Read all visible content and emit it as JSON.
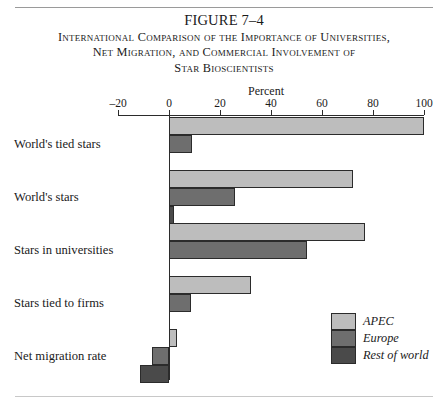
{
  "figure": {
    "number": "FIGURE 7–4",
    "title_lines": [
      "International Comparison of the Importance of Universities,",
      "Net Migration, and Commercial Involvement of",
      "Star Bioscientists"
    ]
  },
  "chart_data": {
    "type": "bar",
    "orientation": "horizontal",
    "title": "International Comparison of the Importance of Universities, Net Migration, and Commercial Involvement of Star Bioscientists",
    "xlabel": "Percent",
    "ylabel": "",
    "xlim": [
      -20,
      100
    ],
    "xticks": [
      -20,
      0,
      20,
      40,
      60,
      80,
      100
    ],
    "xticklabels": [
      "–20",
      "0",
      "20",
      "40",
      "60",
      "80",
      "100"
    ],
    "grid": false,
    "legend_position": "bottom-right",
    "categories": [
      "World's tied stars",
      "World's stars",
      "Stars in universities",
      "Stars tied to firms",
      "Net migration rate"
    ],
    "series": [
      {
        "name": "APEC",
        "color": "#bdbdbd",
        "values": [
          100,
          72,
          77,
          32,
          3
        ]
      },
      {
        "name": "Europe",
        "color": "#6e6e6e",
        "values": [
          9,
          26,
          54,
          8.5,
          -6.5
        ]
      },
      {
        "name": "Rest of world",
        "color": "#4a4a4a",
        "values": [
          0,
          2,
          0,
          0,
          -11.5
        ]
      }
    ]
  }
}
